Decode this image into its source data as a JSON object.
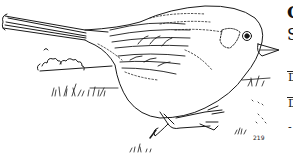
{
  "image": {
    "subject": "sparrow line drawing",
    "style": "black ink outline on white",
    "colors": {
      "ink": "#1a1a1a",
      "background": "#ffffff"
    }
  },
  "edge_text_fragments": {
    "line1": "C",
    "line2": "S",
    "line3": "D",
    "line4": "D",
    "line5": "-"
  },
  "scribbles": {
    "small_label": "219"
  }
}
